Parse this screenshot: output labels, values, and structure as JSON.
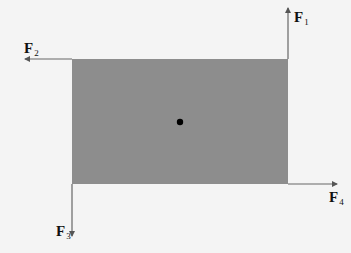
{
  "diagram": {
    "title": "",
    "body": {
      "shape": "rectangle",
      "fill": "#8d8d8d",
      "center_dot": true
    },
    "forces": [
      {
        "id": "F1",
        "base": "F",
        "sub": "1",
        "direction": "up",
        "location": "top-right corner"
      },
      {
        "id": "F2",
        "base": "F",
        "sub": "2",
        "direction": "left",
        "location": "top-left corner"
      },
      {
        "id": "F3",
        "base": "F",
        "sub": "3",
        "direction": "down",
        "location": "bottom-left corner"
      },
      {
        "id": "F4",
        "base": "F",
        "sub": "4",
        "direction": "right",
        "location": "bottom-right corner"
      }
    ]
  }
}
